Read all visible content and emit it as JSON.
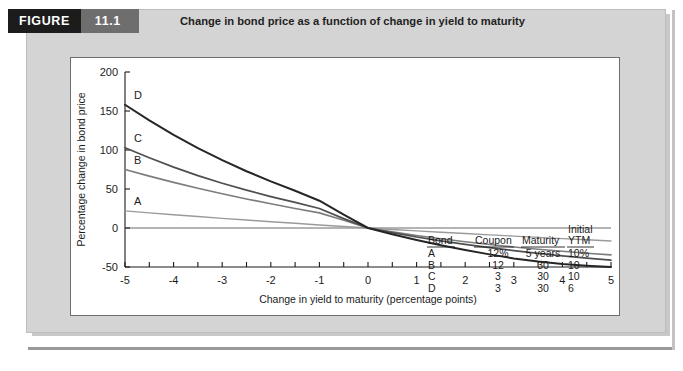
{
  "figure": {
    "tag_label": "FIGURE",
    "number": "11.1",
    "title": "Change in bond price as a function of change in yield to maturity",
    "tag_bg": "#1c1c1c",
    "number_bg": "#6e6e6e",
    "panel_bg": "#d4d4d4"
  },
  "chart_data": {
    "type": "line",
    "title": "Change in bond price as a function of change in yield to maturity",
    "xlabel": "Change in yield to maturity (percentage points)",
    "ylabel": "Percentage change in bond price",
    "xlim": [
      -5,
      5
    ],
    "ylim": [
      -50,
      200
    ],
    "xticks": [
      -5,
      -4,
      -3,
      -2,
      -1,
      0,
      1,
      2,
      3,
      4,
      5
    ],
    "xtick_labels": [
      "-5",
      "-4",
      "-3",
      "-2",
      "-1",
      "0",
      "1",
      "2",
      "3",
      "4",
      "5"
    ],
    "minor_xtick_step": 0.5,
    "yticks": [
      -50,
      0,
      50,
      100,
      150,
      200
    ],
    "ytick_labels": [
      "-50",
      "0",
      "50",
      "100",
      "150",
      "200"
    ],
    "grid": false,
    "legend_position": "inside-bottom-right",
    "x": [
      -5,
      -4.5,
      -4,
      -3.5,
      -3,
      -2.5,
      -2,
      -1.5,
      -1,
      -0.5,
      0,
      0.5,
      1,
      1.5,
      2,
      2.5,
      3,
      3.5,
      4,
      4.5,
      5
    ],
    "series": [
      {
        "name": "A",
        "label": "A",
        "color": "#9a9a9a",
        "width": 1.4,
        "values": [
          21.9,
          19.4,
          17.0,
          14.7,
          12.4,
          10.2,
          8.1,
          6.0,
          3.9,
          1.9,
          0.0,
          -1.9,
          -3.7,
          -5.4,
          -7.1,
          -8.8,
          -10.4,
          -12.0,
          -13.6,
          -15.1,
          -16.6
        ]
      },
      {
        "name": "B",
        "label": "B",
        "color": "#7d7d7d",
        "width": 1.6,
        "values": [
          75.0,
          66.5,
          58.5,
          51.0,
          44.0,
          37.3,
          31.0,
          25.0,
          19.4,
          10.0,
          0.0,
          -5.0,
          -9.7,
          -13.8,
          -17.6,
          -21.1,
          -24.3,
          -27.2,
          -29.9,
          -32.3,
          -34.5
        ]
      },
      {
        "name": "C",
        "label": "C",
        "color": "#4f4f4f",
        "width": 1.7,
        "values": [
          103.0,
          90.0,
          78.0,
          67.2,
          57.4,
          48.5,
          40.3,
          32.8,
          25.0,
          12.0,
          0.0,
          -6.0,
          -11.5,
          -16.5,
          -21.0,
          -25.2,
          -29.0,
          -32.5,
          -35.7,
          -38.6,
          -41.3
        ]
      },
      {
        "name": "D",
        "label": "D",
        "color": "#262626",
        "width": 2.0,
        "values": [
          158.0,
          138.0,
          119.5,
          102.5,
          87.0,
          72.8,
          59.8,
          47.8,
          35.0,
          17.0,
          0.0,
          -8.0,
          -15.3,
          -22.0,
          -28.2,
          -33.8,
          -39.0,
          -43.0,
          -46.2,
          -48.4,
          -50.0
        ]
      }
    ],
    "legend_table": {
      "columns": [
        "Bond",
        "Coupon",
        "Maturity",
        "Initial YTM"
      ],
      "column_display": [
        {
          "line1": "",
          "line2": "Bond"
        },
        {
          "line1": "",
          "line2": "Coupon"
        },
        {
          "line1": "",
          "line2": "Maturity"
        },
        {
          "line1": "Initial",
          "line2": "YTM"
        }
      ],
      "rows": [
        {
          "bond": "A",
          "coupon": "12%",
          "maturity": "5 years",
          "ytm": "10%"
        },
        {
          "bond": "B",
          "coupon": "12",
          "maturity": "30",
          "ytm": "10"
        },
        {
          "bond": "C",
          "coupon": "3",
          "maturity": "30",
          "ytm": "10"
        },
        {
          "bond": "D",
          "coupon": "3",
          "maturity": "30",
          "ytm": "6"
        }
      ]
    }
  }
}
